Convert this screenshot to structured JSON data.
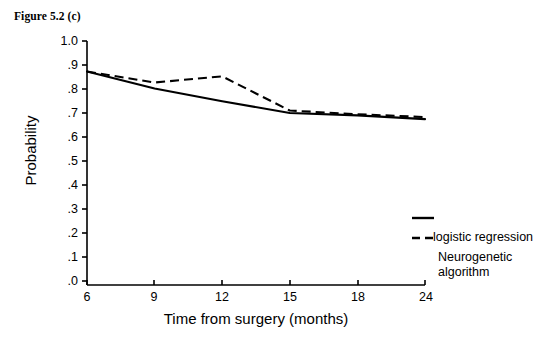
{
  "figure": {
    "caption": "Figure 5.2 (c)"
  },
  "chart_data": {
    "type": "line",
    "title": "Figure 5.2 (c)",
    "xlabel": "Time from surgery (months)",
    "ylabel": "Probability",
    "x": [
      6,
      9,
      12,
      15,
      18,
      24
    ],
    "categories": [
      "6",
      "9",
      "12",
      "15",
      "18",
      "24"
    ],
    "xtick_labels": [
      "6",
      "9",
      "12",
      "15",
      "18",
      "24"
    ],
    "ytick_labels": [
      ".0",
      ".1",
      ".2",
      ".3",
      ".4",
      ".5",
      ".6",
      ".7",
      ".8",
      ".9",
      "1.0"
    ],
    "ytick_values": [
      0.0,
      0.1,
      0.2,
      0.3,
      0.4,
      0.5,
      0.6,
      0.7,
      0.8,
      0.9,
      1.0
    ],
    "ylim": [
      0.0,
      1.0
    ],
    "grid": false,
    "legend_position": "right",
    "axis_color": "#000000",
    "series": [
      {
        "name": "logistic regression",
        "style": "solid",
        "color": "#000000",
        "values": [
          0.875,
          0.805,
          0.753,
          0.705,
          0.695,
          0.68
        ]
      },
      {
        "name": "Neurogenetic algorithm",
        "style": "dashed",
        "color": "#000000",
        "values": [
          0.875,
          0.83,
          0.855,
          0.715,
          0.7,
          0.688
        ]
      }
    ]
  },
  "legend": {
    "entries": [
      {
        "label": "logistic regression",
        "style": "solid"
      },
      {
        "label": "Neurogenetic algorithm",
        "label_line1": "Neurogenetic",
        "label_line2": "algorithm",
        "style": "dashed"
      }
    ]
  }
}
